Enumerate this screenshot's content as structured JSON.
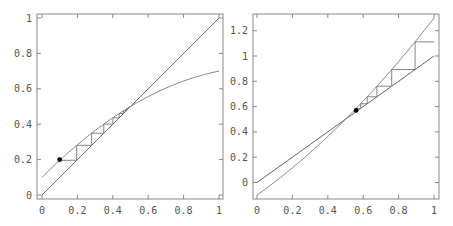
{
  "chart_data": [
    {
      "type": "line",
      "title": "",
      "xlabel": "",
      "ylabel": "",
      "xlim": [
        0,
        1
      ],
      "ylim": [
        0,
        1
      ],
      "grid": false,
      "x_ticks": [
        "0",
        "0.2",
        "0.4",
        "0.6",
        "0.8",
        "1"
      ],
      "y_ticks": [
        "0",
        "0.2",
        "0.4",
        "0.6",
        "0.8",
        "1"
      ],
      "series": [
        {
          "name": "identity y=x",
          "function": "x",
          "x": [
            0,
            1
          ],
          "y": [
            0,
            1
          ]
        },
        {
          "name": "map f(x)",
          "function": "0.1 + x - 0.4x^2",
          "x": [
            0,
            0.5,
            1
          ],
          "y": [
            0.1,
            0.5,
            0.7
          ]
        },
        {
          "name": "cobweb",
          "start_point": [
            0.1,
            0.196
          ],
          "iterates_x": [
            0.1,
            0.196,
            0.28,
            0.349,
            0.4,
            0.436,
            0.46
          ]
        }
      ],
      "annotations": [
        {
          "type": "point",
          "x": 0.1,
          "y": 0.2
        }
      ],
      "fixed_point": [
        0.5,
        0.5
      ]
    },
    {
      "type": "line",
      "title": "",
      "xlabel": "",
      "ylabel": "",
      "xlim": [
        0,
        1
      ],
      "ylim": [
        -0.1,
        1.3
      ],
      "grid": false,
      "x_ticks": [
        "0",
        "0.2",
        "0.4",
        "0.6",
        "0.8",
        "1"
      ],
      "y_ticks": [
        "0",
        "0.2",
        "0.4",
        "0.6",
        "0.8",
        "1",
        "1.2"
      ],
      "series": [
        {
          "name": "identity y=x",
          "function": "x",
          "x": [
            0,
            1
          ],
          "y": [
            0,
            1
          ]
        },
        {
          "name": "map g(x)",
          "function": "-0.1 + x + 0.4x^2",
          "x": [
            0,
            0.5,
            1
          ],
          "y": [
            -0.1,
            0.5,
            1.3
          ]
        },
        {
          "name": "cobweb",
          "start_point": [
            0.56,
            0.57
          ],
          "iterates_x": [
            0.56,
            0.585,
            0.622,
            0.677,
            0.76,
            0.82,
            0.99
          ]
        }
      ],
      "annotations": [
        {
          "type": "point",
          "x": 0.56,
          "y": 0.57
        }
      ],
      "fixed_point": [
        0.5,
        0.5
      ]
    }
  ]
}
